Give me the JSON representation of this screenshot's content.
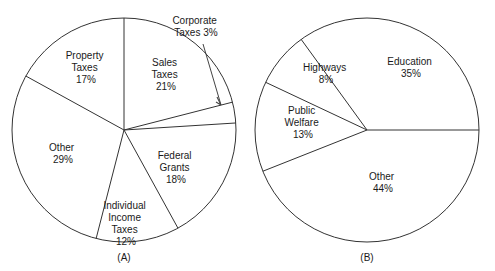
{
  "figure": {
    "title": "",
    "background_color": "#ffffff",
    "stroke_color": "#333333",
    "text_color": "#1a1a1a"
  },
  "chart_data": [
    {
      "type": "pie",
      "id": "A",
      "title": "",
      "caption": "(A)",
      "legend_position": "none",
      "grid": false,
      "labels_inside": true,
      "center": [
        124,
        130
      ],
      "radius": 112,
      "start_angle_deg": 90,
      "direction": "clockwise",
      "categories": [
        "Sales Taxes",
        "Corporate Taxes",
        "Federal Grants",
        "Individual Income Taxes",
        "Other",
        "Property Taxes"
      ],
      "values": [
        21,
        3,
        18,
        12,
        29,
        17
      ],
      "value_suffix": "%",
      "slices": [
        {
          "name": "Sales Taxes",
          "value": 21,
          "label_line1": "Sales",
          "label_line2": "Taxes",
          "label_line3": "21%",
          "label_x": 166,
          "label_y": 70,
          "callout": false
        },
        {
          "name": "Corporate Taxes",
          "value": 3,
          "label_line1": "Corporate",
          "label_line2": "Taxes 3%",
          "label_line3": "",
          "label_x": 196,
          "label_y": 27,
          "callout": true
        },
        {
          "name": "Federal Grants",
          "value": 18,
          "label_line1": "Federal",
          "label_line2": "Grants",
          "label_line3": "18%",
          "label_x": 176,
          "label_y": 168,
          "callout": false
        },
        {
          "name": "Individual Income Taxes",
          "value": 12,
          "label_line1": "Individual",
          "label_line2": "Income",
          "label_line3": "Taxes",
          "label_line4": "12%",
          "label_x": 126,
          "label_y": 215,
          "callout": false
        },
        {
          "name": "Other",
          "value": 29,
          "label_line1": "Other",
          "label_line2": "29%",
          "label_line3": "",
          "label_x": 63,
          "label_y": 153,
          "callout": false
        },
        {
          "name": "Property Taxes",
          "value": 17,
          "label_line1": "Property",
          "label_line2": "Taxes",
          "label_line3": "17%",
          "label_x": 86,
          "label_y": 62,
          "callout": false
        }
      ]
    },
    {
      "type": "pie",
      "id": "B",
      "title": "",
      "caption": "(B)",
      "legend_position": "none",
      "grid": false,
      "labels_inside": true,
      "center": [
        367,
        130
      ],
      "radius": 112,
      "start_angle_deg": 0,
      "direction": "counterclockwise",
      "categories": [
        "Education",
        "Highways",
        "Public Welfare",
        "Other"
      ],
      "values": [
        35,
        8,
        13,
        44
      ],
      "value_suffix": "%",
      "slices": [
        {
          "name": "Education",
          "value": 35,
          "label_line1": "Education",
          "label_line2": "35%",
          "label_line3": "",
          "label_x": 411,
          "label_y": 68,
          "callout": false
        },
        {
          "name": "Highways",
          "value": 8,
          "label_line1": "Highways",
          "label_line2": "8%",
          "label_line3": "",
          "label_x": 326,
          "label_y": 74,
          "callout": false
        },
        {
          "name": "Public Welfare",
          "value": 13,
          "label_line1": "Public",
          "label_line2": "Welfare",
          "label_line3": "13%",
          "label_x": 303,
          "label_y": 123,
          "callout": false
        },
        {
          "name": "Other",
          "value": 44,
          "label_line1": "Other",
          "label_line2": "44%",
          "label_line3": "",
          "label_x": 383,
          "label_y": 183,
          "callout": false
        }
      ]
    }
  ],
  "captions": {
    "a": "(A)",
    "b": "(B)"
  },
  "callout": {
    "line1": "Corporate",
    "line2": "Taxes 3%"
  },
  "labels": {
    "a_sales_1": "Sales",
    "a_sales_2": "Taxes",
    "a_sales_3": "21%",
    "a_property_1": "Property",
    "a_property_2": "Taxes",
    "a_property_3": "17%",
    "a_other_1": "Other",
    "a_other_2": "29%",
    "a_individual_1": "Individual",
    "a_individual_2": "Income",
    "a_individual_3": "Taxes",
    "a_individual_4": "12%",
    "a_federal_1": "Federal",
    "a_federal_2": "Grants",
    "a_federal_3": "18%",
    "b_education_1": "Education",
    "b_education_2": "35%",
    "b_highways_1": "Highways",
    "b_highways_2": "8%",
    "b_welfare_1": "Public",
    "b_welfare_2": "Welfare",
    "b_welfare_3": "13%",
    "b_other_1": "Other",
    "b_other_2": "44%"
  }
}
